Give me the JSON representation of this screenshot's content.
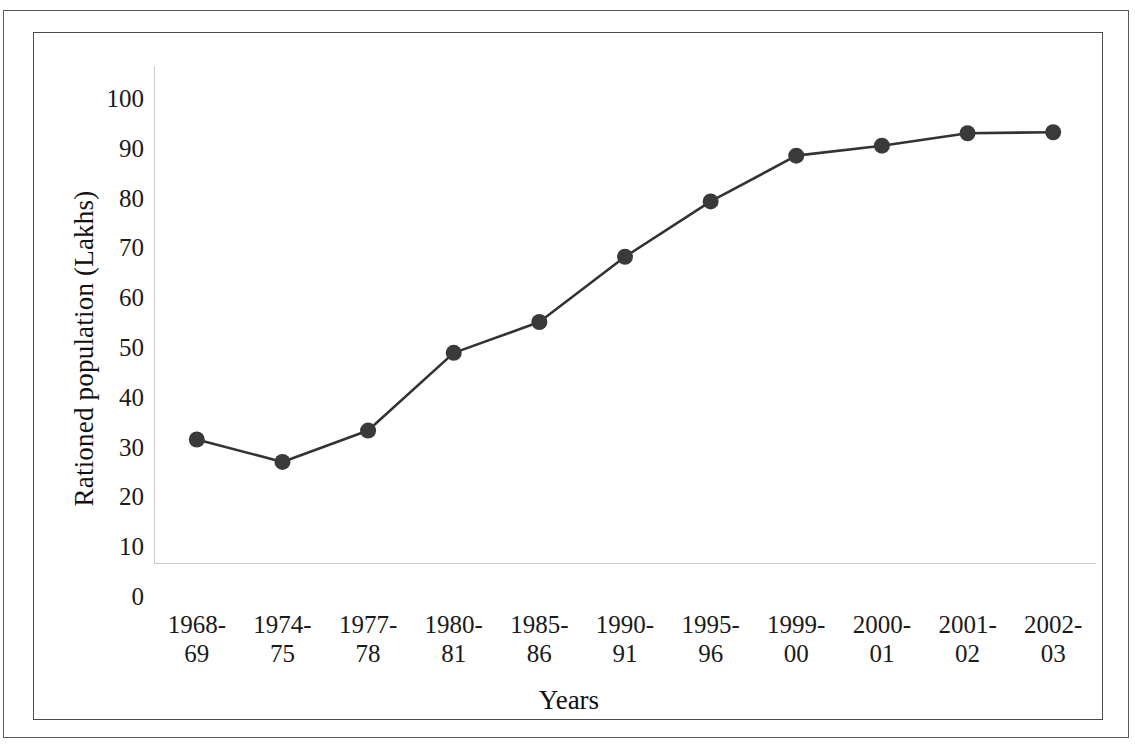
{
  "chart_data": {
    "type": "line",
    "title": "",
    "xlabel": "Years",
    "ylabel": "Rationed population (Lakhs)",
    "categories": [
      "1968-69",
      "1974-75",
      "1977-78",
      "1980-81",
      "1985-86",
      "1990-91",
      "1995-96",
      "1999-00",
      "2000-01",
      "2001-02",
      "2002-03"
    ],
    "values": [
      25.0,
      20.5,
      26.8,
      42.4,
      48.6,
      61.7,
      72.8,
      82.0,
      84.0,
      86.5,
      86.7
    ],
    "ylim": [
      0,
      100
    ],
    "y_ticks": [
      0,
      10,
      20,
      30,
      40,
      50,
      60,
      70,
      80,
      90,
      100
    ],
    "y_tick_labels": [
      "0",
      "10",
      "20",
      "30",
      "40",
      "50",
      "60",
      "70",
      "80",
      "90",
      "100"
    ],
    "grid": false,
    "tick_marks": true,
    "legend": "none",
    "series": [
      {
        "name": "Rationed population",
        "values": [
          25.0,
          20.5,
          26.8,
          42.4,
          48.6,
          61.7,
          72.8,
          82.0,
          84.0,
          86.5,
          86.7
        ],
        "marker": "filled-circle",
        "line_color": "#333333",
        "marker_color": "#3a3a3a"
      }
    ]
  },
  "x_tick_lines": [
    {
      "top": "1968-",
      "bottom": "69"
    },
    {
      "top": "1974-",
      "bottom": "75"
    },
    {
      "top": "1977-",
      "bottom": "78"
    },
    {
      "top": "1980-",
      "bottom": "81"
    },
    {
      "top": "1985-",
      "bottom": "86"
    },
    {
      "top": "1990-",
      "bottom": "91"
    },
    {
      "top": "1995-",
      "bottom": "96"
    },
    {
      "top": "1999-",
      "bottom": "00"
    },
    {
      "top": "2000-",
      "bottom": "01"
    },
    {
      "top": "2001-",
      "bottom": "02"
    },
    {
      "top": "2002-",
      "bottom": "03"
    }
  ],
  "colors": {
    "line": "#333333",
    "marker": "#3a3a3a",
    "axis": "#b8b8b8",
    "frame": "#4a4a4a",
    "page_border": "#5a5a5a",
    "text": "#1a1a1a",
    "background": "#ffffff"
  }
}
